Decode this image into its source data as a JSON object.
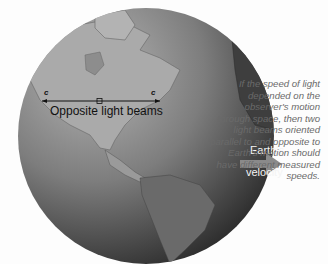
{
  "figure": {
    "type": "diagram"
  },
  "labels": {
    "beam_label": "Opposite light beams",
    "c_left": "c",
    "c_right": "c",
    "velocity_line1": "Earth's",
    "velocity_line2": "velocity"
  },
  "caption": {
    "text": "If the speed of light depended on the observer's motion through space, then two light beams oriented parallel to and opposite to Earth's motion should have different measured speeds."
  },
  "colors": {
    "background": "#fdfdfd",
    "ocean_light": "#9a9a9a",
    "ocean_dark": "#1e1e1e",
    "land": "#a8a8a8",
    "arrow": "#8a8a8a",
    "caption_text": "#6a6a6a"
  }
}
